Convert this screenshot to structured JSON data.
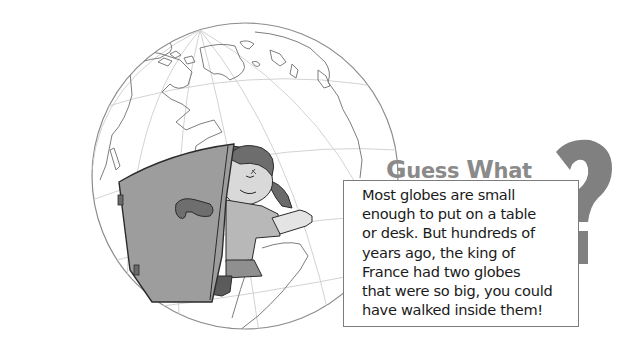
{
  "illustration": {
    "subject": "globe-with-girl-opening-door",
    "colors": {
      "globe_outline": "#7a7a7a",
      "grid_lines": "#cfcfcf",
      "door_fill": "#9a9a9a",
      "door_outline": "#2b2b2b",
      "question_mark": "#808080"
    }
  },
  "callout": {
    "heading_first": "G",
    "heading_rest1": "uess ",
    "heading_second": "W",
    "heading_rest2": "hat",
    "body_lines": [
      "Most globes are small",
      "enough to put on a table",
      "or desk. But hundreds of",
      "years ago, the king of",
      "France had two globes",
      "that were so big, you could",
      "have walked inside them!"
    ]
  }
}
